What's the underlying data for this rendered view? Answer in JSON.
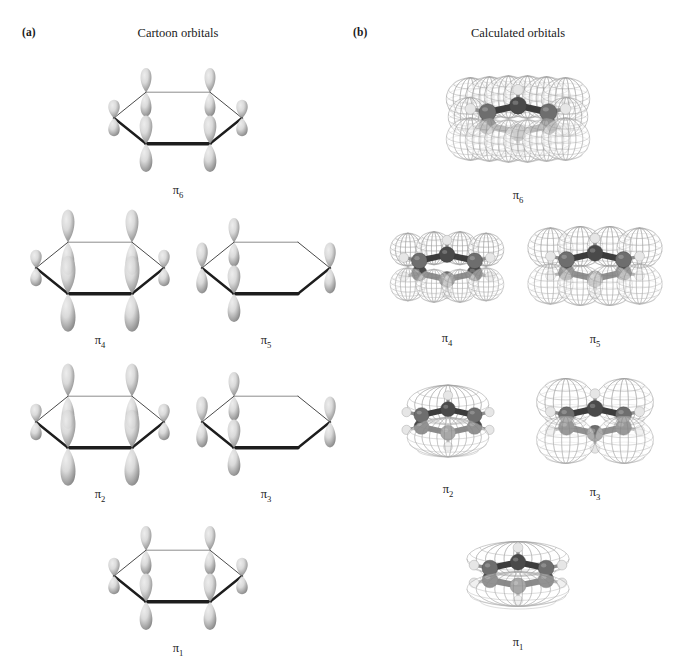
{
  "figure": {
    "background_color": "#ffffff"
  },
  "panels": [
    {
      "tag": "(a)",
      "title": "Cartoon orbitals",
      "tag_x": 22,
      "tag_y": 26,
      "title_cx": 178,
      "title_y": 26
    },
    {
      "tag": "(b)",
      "title": "Calculated orbitals",
      "tag_x": 353,
      "tag_y": 26,
      "title_cx": 518,
      "title_y": 26
    }
  ],
  "rows": [
    {
      "name": "pi6",
      "top": 58,
      "label_y": 178
    },
    {
      "name": "pi4_pi5",
      "top": 208,
      "label_y": 322
    },
    {
      "name": "pi2_pi3",
      "top": 362,
      "label_y": 477
    },
    {
      "name": "pi1",
      "top": 516,
      "label_y": 632
    }
  ],
  "orbitals": {
    "cartoon": [
      {
        "id": "cartoon-pi6",
        "label": "π",
        "sub": "6",
        "x": 98,
        "y": 58,
        "w": 160,
        "h": 120,
        "lobe_scale": [
          0.72,
          1.0,
          1.0,
          0.72,
          1.0,
          1.0
        ],
        "phase": [
          1,
          1,
          1,
          1,
          1,
          1
        ],
        "description": "antibonding, all adjacent lobes out of phase"
      },
      {
        "id": "cartoon-pi4",
        "label": "π",
        "sub": "4",
        "x": 20,
        "y": 208,
        "w": 160,
        "h": 120,
        "lobe_scale": [
          0.72,
          1.35,
          1.35,
          0.72,
          1.35,
          1.35
        ],
        "phase": [
          1,
          1,
          1,
          1,
          1,
          1
        ],
        "description": "antibonding with large lobes at top and bottom vertices"
      },
      {
        "id": "cartoon-pi5",
        "label": "π",
        "sub": "5",
        "x": 186,
        "y": 208,
        "w": 160,
        "h": 120,
        "lobe_scale": [
          1.0,
          1.0,
          0.0,
          1.0,
          0.0,
          1.0
        ],
        "phase": [
          1,
          1,
          0,
          1,
          0,
          1
        ],
        "description": "antibonding with nodes through two opposite carbons"
      },
      {
        "id": "cartoon-pi2",
        "label": "π",
        "sub": "2",
        "x": 20,
        "y": 362,
        "w": 160,
        "h": 120,
        "lobe_scale": [
          0.72,
          1.35,
          1.35,
          0.72,
          1.35,
          1.35
        ],
        "phase": [
          1,
          1,
          1,
          1,
          1,
          1
        ],
        "description": "bonding with large lobes at top and bottom vertices"
      },
      {
        "id": "cartoon-pi3",
        "label": "π",
        "sub": "3",
        "x": 186,
        "y": 362,
        "w": 160,
        "h": 120,
        "lobe_scale": [
          1.0,
          1.0,
          0.0,
          1.0,
          0.0,
          1.0
        ],
        "phase": [
          1,
          1,
          0,
          1,
          0,
          1
        ],
        "description": "bonding with nodes through two opposite carbons"
      },
      {
        "id": "cartoon-pi1",
        "label": "π",
        "sub": "1",
        "x": 98,
        "y": 516,
        "w": 160,
        "h": 120,
        "lobe_scale": [
          0.72,
          1.0,
          1.0,
          0.72,
          1.0,
          1.0
        ],
        "phase": [
          1,
          1,
          1,
          1,
          1,
          1
        ],
        "description": "fully bonding, all six p orbitals in phase"
      }
    ],
    "calculated": [
      {
        "id": "calc-pi6",
        "label": "π",
        "sub": "6",
        "x": 440,
        "y": 55,
        "w": 156,
        "h": 128,
        "lobe_count": 12,
        "lobe_size": "large",
        "description": "six mesh lobes above and six below the ring"
      },
      {
        "id": "calc-pi4",
        "label": "π",
        "sub": "4",
        "x": 376,
        "y": 208,
        "w": 142,
        "h": 118,
        "lobe_count": 8,
        "lobe_size": "medium",
        "description": "four mesh lobes above and four below the ring"
      },
      {
        "id": "calc-pi5",
        "label": "π",
        "sub": "5",
        "x": 522,
        "y": 205,
        "w": 146,
        "h": 122,
        "lobe_count": 8,
        "lobe_size": "large",
        "description": "four large mesh lobes above and four below the ring"
      },
      {
        "id": "calc-pi2",
        "label": "π",
        "sub": "2",
        "x": 380,
        "y": 365,
        "w": 136,
        "h": 112,
        "lobe_count": 2,
        "lobe_size": "medium",
        "description": "single delocalised mesh cap above and below the ring"
      },
      {
        "id": "calc-pi3",
        "label": "π",
        "sub": "3",
        "x": 522,
        "y": 362,
        "w": 146,
        "h": 118,
        "lobe_count": 4,
        "lobe_size": "large",
        "description": "two mesh lobes above and two below the ring"
      },
      {
        "id": "calc-pi1",
        "label": "π",
        "sub": "1",
        "x": 446,
        "y": 518,
        "w": 144,
        "h": 112,
        "lobe_count": 2,
        "lobe_size": "enveloping",
        "description": "continuous mesh envelope sandwiching the whole ring"
      }
    ]
  },
  "colors": {
    "lobe_light": "#d8d8d8",
    "lobe_mid": "#a9a9a9",
    "lobe_dark": "#7d7d7d",
    "ring_line": "#1d1d1d",
    "ring_line_far": "#707070",
    "mesh": "#9b9b9b",
    "carbon": "#6e6e6e",
    "carbon_dark": "#4a4a4a",
    "hydrogen": "#e6e6e6",
    "bond": "#3c3c3c",
    "text": "#1a1a1a"
  }
}
